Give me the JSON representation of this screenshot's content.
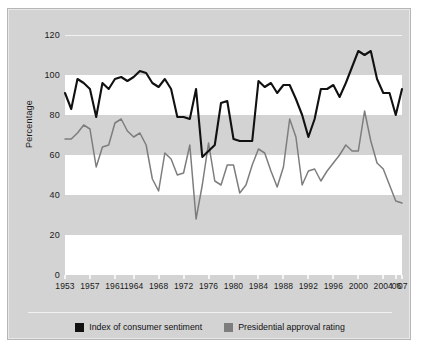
{
  "chart_data": {
    "type": "line",
    "title": "",
    "xlabel": "",
    "ylabel": "Percentage",
    "ylim": [
      0,
      120
    ],
    "yticks": [
      0,
      20,
      40,
      60,
      80,
      100,
      120
    ],
    "xtick_labels": [
      "1953",
      "1957",
      "1961",
      "1964",
      "1968",
      "1972",
      "1976",
      "1980",
      "1984",
      "1988",
      "1992",
      "1996",
      "2000",
      "2004",
      "'06",
      "'07"
    ],
    "xtick_years": [
      1953,
      1957,
      1961,
      1964,
      1968,
      1972,
      1976,
      1980,
      1984,
      1988,
      1992,
      1996,
      2000,
      2004,
      2006,
      2007
    ],
    "x_range": [
      1953,
      2007
    ],
    "grid": "horizontal-banded",
    "band_shading": "alternating white bands at 0-20, 40-60, 80-100 over gray background",
    "legend_position": "bottom-center",
    "series": [
      {
        "name": "Index of consumer sentiment",
        "color": "#111111",
        "x": [
          1953,
          1954,
          1955,
          1956,
          1957,
          1958,
          1959,
          1960,
          1961,
          1962,
          1963,
          1964,
          1965,
          1966,
          1967,
          1968,
          1969,
          1970,
          1971,
          1972,
          1973,
          1974,
          1975,
          1976,
          1977,
          1978,
          1979,
          1980,
          1981,
          1982,
          1983,
          1984,
          1985,
          1986,
          1987,
          1988,
          1989,
          1990,
          1991,
          1992,
          1993,
          1994,
          1995,
          1996,
          1997,
          1998,
          1999,
          2000,
          2001,
          2002,
          2003,
          2004,
          2005,
          2006,
          2007
        ],
        "values": [
          91,
          83,
          98,
          96,
          93,
          79,
          96,
          93,
          98,
          99,
          97,
          99,
          102,
          101,
          96,
          94,
          98,
          93,
          79,
          79,
          78,
          93,
          59,
          62,
          65,
          86,
          87,
          68,
          67,
          67,
          67,
          97,
          94,
          96,
          91,
          95,
          95,
          88,
          80,
          69,
          78,
          93,
          93,
          95,
          89,
          96,
          104,
          112,
          110,
          112,
          98,
          91,
          91,
          80,
          93
        ]
      },
      {
        "name": "Presidential approval rating",
        "color": "#7d7d7d",
        "x": [
          1953,
          1954,
          1955,
          1956,
          1957,
          1958,
          1959,
          1960,
          1961,
          1962,
          1963,
          1964,
          1965,
          1966,
          1967,
          1968,
          1969,
          1970,
          1971,
          1972,
          1973,
          1974,
          1975,
          1976,
          1977,
          1978,
          1979,
          1980,
          1981,
          1982,
          1983,
          1984,
          1985,
          1986,
          1987,
          1988,
          1989,
          1990,
          1991,
          1992,
          1993,
          1994,
          1995,
          1996,
          1997,
          1998,
          1999,
          2000,
          2001,
          2002,
          2003,
          2004,
          2005,
          2006,
          2007
        ],
        "values": [
          68,
          68,
          71,
          75,
          73,
          54,
          64,
          65,
          76,
          78,
          72,
          69,
          71,
          65,
          48,
          42,
          61,
          58,
          50,
          51,
          65,
          28,
          45,
          66,
          47,
          45,
          55,
          55,
          41,
          45,
          55,
          63,
          61,
          52,
          44,
          54,
          78,
          69,
          45,
          52,
          53,
          47,
          52,
          56,
          60,
          65,
          62,
          62,
          82,
          67,
          56,
          53,
          45,
          37,
          36
        ]
      }
    ]
  },
  "legend": {
    "items": [
      {
        "label": "Index of consumer sentiment",
        "color": "#111111",
        "swatch_name": "legend-swatch-black"
      },
      {
        "label": "Presidential approval rating",
        "color": "#7d7d7d",
        "swatch_name": "legend-swatch-gray"
      }
    ]
  },
  "colors": {
    "panel_background": "#d3d3d3",
    "band_white": "#ffffff",
    "series_black": "#111111",
    "series_gray": "#7d7d7d",
    "text": "#1a1a1a"
  }
}
